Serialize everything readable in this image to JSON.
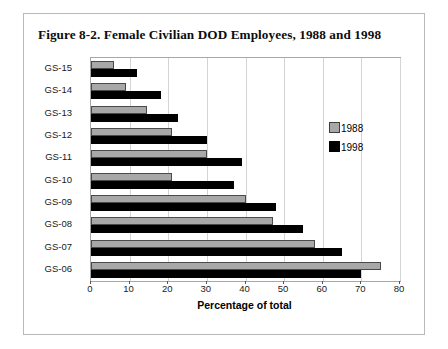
{
  "figure": {
    "title": "Figure 8-2. Female Civilian DOD Employees, 1988 and 1998"
  },
  "chart_data": {
    "type": "bar",
    "orientation": "horizontal",
    "title": "Figure 8-2. Female Civilian DOD Employees, 1988 and 1998",
    "xlabel": "Percentage of total",
    "ylabel": "",
    "xlim": [
      0,
      80
    ],
    "xticks": [
      0,
      10,
      20,
      30,
      40,
      50,
      60,
      70,
      80
    ],
    "grid": true,
    "legend_position": "inside-upper-right",
    "categories": [
      "GS-15",
      "GS-14",
      "GS-13",
      "GS-12",
      "GS-11",
      "GS-10",
      "GS-09",
      "GS-08",
      "GS-07",
      "GS-06"
    ],
    "series": [
      {
        "name": "1988",
        "color": "#a8a8a8",
        "values": [
          6,
          9,
          14.5,
          21,
          30,
          21,
          40,
          47,
          58,
          75
        ]
      },
      {
        "name": "1998",
        "color": "#000000",
        "values": [
          12,
          18,
          22.5,
          30,
          39,
          37,
          48,
          55,
          65,
          70
        ]
      }
    ]
  }
}
